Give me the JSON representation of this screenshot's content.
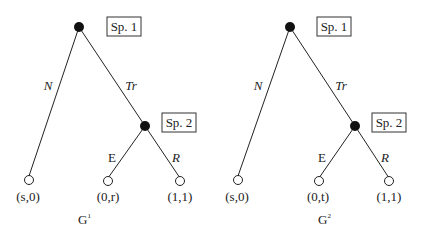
{
  "trees": [
    {
      "name": "G",
      "superscript": "1",
      "root_player": "Sp. 1",
      "second_player": "Sp. 2",
      "actions": {
        "left": "N",
        "right": "Tr",
        "sub_left": "E",
        "sub_right": "R"
      },
      "payoffs": {
        "N": "(s,0)",
        "E": "(0,r)",
        "R": "(1,1)"
      }
    },
    {
      "name": "G",
      "superscript": "2",
      "root_player": "Sp. 1",
      "second_player": "Sp. 2",
      "actions": {
        "left": "N",
        "right": "Tr",
        "sub_left": "E",
        "sub_right": "R"
      },
      "payoffs": {
        "N": "(s,0)",
        "E": "(0,t)",
        "R": "(1,1)"
      }
    }
  ]
}
